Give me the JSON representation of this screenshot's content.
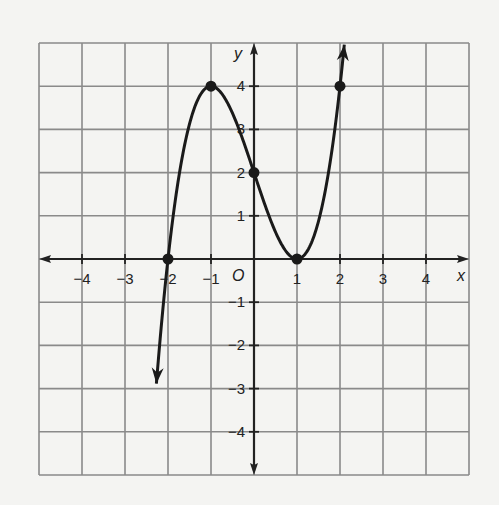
{
  "chart_data": {
    "type": "line",
    "title": "",
    "xlabel": "x",
    "ylabel": "y",
    "origin_label": "O",
    "xlim": [
      -5,
      5
    ],
    "ylim": [
      -5,
      5
    ],
    "grid": true,
    "x_ticks": [
      -4,
      -3,
      -2,
      -1,
      1,
      2,
      3,
      4
    ],
    "y_ticks": [
      -4,
      -3,
      -2,
      -1,
      1,
      2,
      3,
      4
    ],
    "x_tick_labels": [
      "−4",
      "−3",
      "−2",
      "−1",
      "1",
      "2",
      "3",
      "4"
    ],
    "y_tick_labels": [
      "−4",
      "−3",
      "−2",
      "−1",
      "1",
      "2",
      "3",
      "4"
    ],
    "function": "y = x^3 - 3x + 2",
    "curve_domain": [
      -2.27,
      2.1
    ],
    "marked_points": [
      {
        "x": -2,
        "y": 0
      },
      {
        "x": -1,
        "y": 4
      },
      {
        "x": 0,
        "y": 2
      },
      {
        "x": 1,
        "y": 0
      },
      {
        "x": 2,
        "y": 4
      }
    ],
    "series": [
      {
        "name": "f(x)",
        "x": [
          -2,
          -1,
          0,
          1,
          2
        ],
        "values": [
          0,
          4,
          2,
          0,
          4
        ]
      }
    ],
    "legend": null
  },
  "colors": {
    "background": "#f4f4f2",
    "grid": "#8a8a8a",
    "axis": "#222222",
    "curve": "#1a1a1a"
  }
}
